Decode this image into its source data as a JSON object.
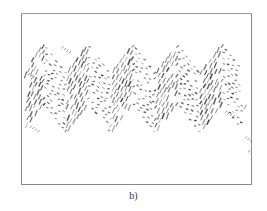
{
  "figure": {
    "caption": "b)",
    "content_description": "zigzag-warped lines of text (distorted document image)",
    "ink_color": "#3a3a3a",
    "frame_color": "#8a8a8a",
    "background_color": "#ffffff"
  }
}
